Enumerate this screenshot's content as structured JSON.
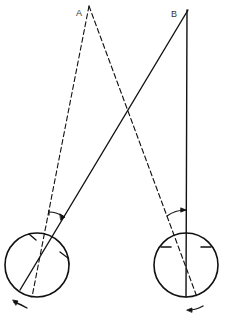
{
  "diagram": {
    "width": 225,
    "height": 317,
    "stroke_color": "#111111",
    "background": "#ffffff",
    "points": {
      "A": {
        "label": "A",
        "x": 89,
        "y": 6
      },
      "B": {
        "label": "B",
        "x": 188,
        "y": 10
      }
    },
    "eyes": [
      {
        "name": "left-eye",
        "cx": 37,
        "cy": 265,
        "r": 32,
        "rotation_arrow": "counterclockwise"
      },
      {
        "name": "right-eye",
        "cx": 186,
        "cy": 265,
        "r": 32,
        "rotation_arrow": "counterclockwise"
      }
    ],
    "lines": [
      {
        "name": "dashed-line-a-left",
        "from": "A",
        "to_xy": [
          32,
          296
        ],
        "style": "dashed"
      },
      {
        "name": "dashed-line-a-right",
        "from": "A",
        "to_xy": [
          197,
          296
        ],
        "style": "dashed"
      },
      {
        "name": "solid-line-b-left",
        "from": "B",
        "to_xy": [
          20,
          290
        ],
        "style": "solid"
      },
      {
        "name": "solid-line-b-vertical",
        "from": "B",
        "to_xy": [
          186,
          297
        ],
        "style": "solid"
      }
    ],
    "angle_arcs": [
      {
        "name": "left-angle-arc",
        "description": "angle between dashed and solid line above left eye"
      },
      {
        "name": "right-angle-arc",
        "description": "angle between dashed and solid line above right eye"
      }
    ]
  }
}
